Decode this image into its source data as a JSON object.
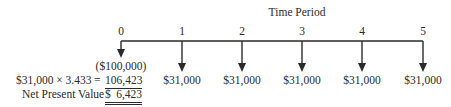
{
  "title": "Time Period",
  "periods": [
    "0",
    "1",
    "2",
    "3",
    "4",
    "5"
  ],
  "cash_flows": [
    "($100,000)",
    "$31,000",
    "$31,000",
    "$31,000",
    "$31,000",
    "$31,000"
  ],
  "calculation": {
    "expression": "$31,000 × 3.433",
    "equals": "=",
    "present_value": "106,423"
  },
  "npv": {
    "label": "Net Present Value",
    "currency": "$",
    "value": "6,423"
  },
  "colors": {
    "ink": "#2a2a2a"
  }
}
